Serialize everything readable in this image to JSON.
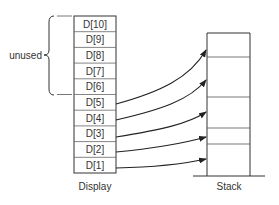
{
  "diagram": {
    "display": {
      "caption": "Display",
      "cells": [
        "D[10]",
        "D[9]",
        "D[8]",
        "D[7]",
        "D[6]",
        "D[5]",
        "D[4]",
        "D[3]",
        "D[2]",
        "D[1]"
      ]
    },
    "unused_bracket": {
      "label": "unused",
      "covers": [
        "D[10]",
        "D[9]",
        "D[8]",
        "D[7]",
        "D[6]"
      ]
    },
    "stack": {
      "caption": "Stack",
      "frames": 5
    },
    "arrows": [
      {
        "from": "D[5]",
        "to": "stack-frame-1"
      },
      {
        "from": "D[4]",
        "to": "stack-frame-2"
      },
      {
        "from": "D[3]",
        "to": "stack-frame-3"
      },
      {
        "from": "D[2]",
        "to": "stack-frame-4"
      },
      {
        "from": "D[1]",
        "to": "stack-frame-5"
      }
    ],
    "colors": {
      "line": "#333333",
      "background": "#ffffff"
    }
  }
}
